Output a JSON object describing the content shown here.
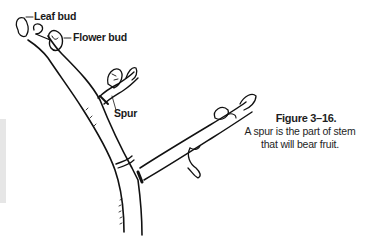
{
  "labels": {
    "leaf_bud": "Leaf bud",
    "flower_bud": "Flower bud",
    "spur": "Spur"
  },
  "caption": {
    "title": "Figure 3–16.",
    "line1": "A spur is the part of stem",
    "line2": "that will bear fruit."
  },
  "colors": {
    "ink": "#111111",
    "side_bar": "#e6e6e6",
    "background": "#ffffff"
  }
}
